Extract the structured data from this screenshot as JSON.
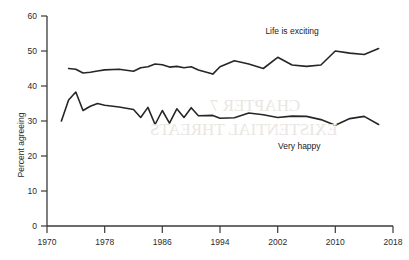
{
  "chart_data": {
    "type": "line",
    "title": "",
    "xlabel": "",
    "ylabel": "Percent agreeing",
    "xlim": [
      1970,
      2018
    ],
    "ylim": [
      0,
      60
    ],
    "grid": false,
    "legend_position": "inline-annotation",
    "xticks": [
      "1970",
      "1978",
      "1986",
      "1994",
      "2002",
      "2010",
      "2018"
    ],
    "yticks": [
      "0",
      "10",
      "20",
      "30",
      "40",
      "50",
      "60"
    ],
    "series": [
      {
        "name": "Life is exciting",
        "label_x": 2004,
        "label_y": 55,
        "x": [
          1973,
          1974,
          1975,
          1976,
          1977,
          1978,
          1980,
          1982,
          1983,
          1984,
          1985,
          1986,
          1987,
          1988,
          1989,
          1990,
          1991,
          1993,
          1994,
          1996,
          1998,
          2000,
          2002,
          2004,
          2006,
          2008,
          2010,
          2012,
          2014,
          2016
        ],
        "values": [
          45.0,
          44.8,
          43.7,
          43.9,
          44.3,
          44.6,
          44.8,
          44.2,
          45.2,
          45.5,
          46.3,
          46.1,
          45.4,
          45.6,
          45.2,
          45.5,
          44.6,
          43.4,
          45.5,
          47.2,
          46.3,
          45.0,
          48.2,
          46.0,
          45.6,
          46.0,
          50.0,
          49.4,
          49.0,
          50.7
        ],
        "color": "#262626"
      },
      {
        "name": "Very happy",
        "label_x": 2005,
        "label_y": 22,
        "x": [
          1972,
          1973,
          1974,
          1975,
          1976,
          1977,
          1978,
          1980,
          1982,
          1983,
          1984,
          1985,
          1986,
          1987,
          1988,
          1989,
          1990,
          1991,
          1993,
          1994,
          1996,
          1998,
          2000,
          2002,
          2004,
          2006,
          2008,
          2010,
          2012,
          2014,
          2016
        ],
        "values": [
          30.0,
          36.0,
          38.3,
          33.0,
          34.2,
          35.0,
          34.5,
          34.0,
          33.3,
          31.0,
          33.9,
          29.0,
          33.0,
          29.4,
          33.5,
          31.0,
          33.8,
          31.5,
          31.6,
          30.8,
          30.9,
          32.3,
          31.8,
          31.0,
          31.4,
          31.3,
          30.4,
          28.8,
          30.7,
          31.3,
          29.0
        ],
        "color": "#262626"
      }
    ]
  },
  "bleed_through": [
    {
      "text": "CHAPTER 7",
      "x": 210,
      "y": 100,
      "size": 17
    },
    {
      "text": "EXISTENTIAL THREATS",
      "x": 155,
      "y": 124,
      "size": 17
    }
  ]
}
